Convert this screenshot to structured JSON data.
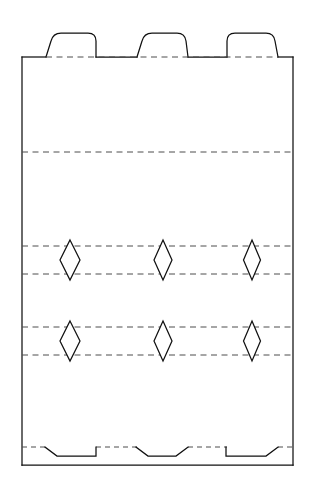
{
  "document": {
    "title": "Die-cut Packaging Template",
    "background_color": "#ffffff",
    "width": 312,
    "height": 491
  },
  "style": {
    "cut_line_color": "#111111",
    "fold_line_color": "#4c4c4c",
    "cut_line_width": 1.25,
    "fold_line_width": 1,
    "fold_dash_pattern": "6 4.5",
    "aperture_fill": "#ffffff"
  },
  "chart_data": {
    "type": "diagram",
    "panel": {
      "left": 22,
      "right": 293,
      "top": 57,
      "bottom": 465,
      "width": 271,
      "height": 408
    },
    "top_tabs": [
      {
        "name": "top-tab-left",
        "base_left": 45,
        "base_right": 96,
        "top": 33,
        "bottom": 57,
        "left_edge": "slanted",
        "right_edge": "vertical",
        "corner_radius": 8
      },
      {
        "name": "top-tab-middle",
        "base_left": 136,
        "base_right": 188,
        "top": 33,
        "bottom": 57,
        "left_edge": "slanted",
        "right_edge": "slanted",
        "corner_radius": 8
      },
      {
        "name": "top-tab-right",
        "base_left": 226,
        "base_right": 278,
        "top": 33,
        "bottom": 57,
        "left_edge": "vertical",
        "right_edge": "slanted",
        "corner_radius": 8
      }
    ],
    "fold_lines_horizontal": [
      {
        "name": "fold-top-edge",
        "y": 57,
        "x_start": 22,
        "x_end": 293,
        "note": "tab fold along panel top"
      },
      {
        "name": "fold-upper",
        "y": 152,
        "x_start": 22,
        "x_end": 293
      },
      {
        "name": "fold-row1-top",
        "y": 246,
        "x_start": 22,
        "x_end": 293
      },
      {
        "name": "fold-row1-bottom",
        "y": 274,
        "x_start": 22,
        "x_end": 293
      },
      {
        "name": "fold-row2-top",
        "y": 327,
        "x_start": 22,
        "x_end": 293
      },
      {
        "name": "fold-row2-bottom",
        "y": 355,
        "x_start": 22,
        "x_end": 293
      },
      {
        "name": "fold-bottom",
        "y": 447,
        "x_start": 22,
        "x_end": 293
      }
    ],
    "apertures": {
      "shape": "diamond",
      "rows": 2,
      "columns": 3,
      "count": 6,
      "centers_x": [
        70,
        163,
        252
      ],
      "row_bands": [
        {
          "top_y": 240,
          "bottom_y": 280,
          "mid_y": 260
        },
        {
          "top_y": 321,
          "bottom_y": 361,
          "mid_y": 341
        }
      ],
      "half_widths": [
        10,
        9,
        8.5
      ],
      "items": [
        {
          "name": "aperture-r1-c1",
          "cx": 70,
          "top_y": 240,
          "bottom_y": 280,
          "half_width": 10
        },
        {
          "name": "aperture-r1-c2",
          "cx": 163,
          "top_y": 240,
          "bottom_y": 280,
          "half_width": 9
        },
        {
          "name": "aperture-r1-c3",
          "cx": 252,
          "top_y": 240,
          "bottom_y": 280,
          "half_width": 8.5
        },
        {
          "name": "aperture-r2-c1",
          "cx": 70,
          "top_y": 321,
          "bottom_y": 361,
          "half_width": 10
        },
        {
          "name": "aperture-r2-c2",
          "cx": 163,
          "top_y": 321,
          "bottom_y": 361,
          "half_width": 9
        },
        {
          "name": "aperture-r2-c3",
          "cx": 252,
          "top_y": 321,
          "bottom_y": 361,
          "half_width": 8.5
        }
      ]
    },
    "bottom_notches": [
      {
        "name": "bottom-notch-left",
        "start_x": 45,
        "end_x": 96,
        "fold_y": 447,
        "depth_y": 456,
        "left_edge": "diagonal",
        "right_edge": "vertical"
      },
      {
        "name": "bottom-notch-middle",
        "start_x": 136,
        "end_x": 188,
        "fold_y": 447,
        "depth_y": 456,
        "left_edge": "diagonal",
        "right_edge": "diagonal"
      },
      {
        "name": "bottom-notch-right",
        "start_x": 226,
        "end_x": 278,
        "fold_y": 447,
        "depth_y": 456,
        "left_edge": "vertical",
        "right_edge": "diagonal"
      }
    ],
    "legend": [],
    "annotations": [],
    "labels": []
  }
}
